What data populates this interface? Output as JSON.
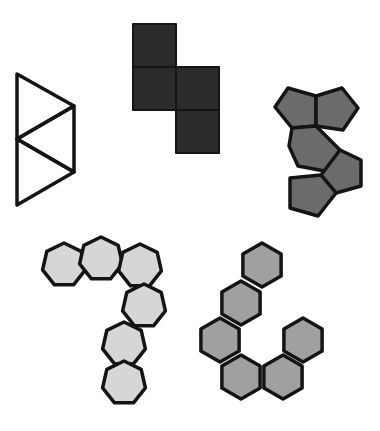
{
  "figure": {
    "width": 380,
    "height": 431,
    "background": "#ffffff",
    "stroke_color": "#141414",
    "shapes": [
      {
        "id": "triangle-strip",
        "kind": "triangles",
        "count": 3,
        "fill": "none",
        "stroke_width": 3.5,
        "polygons": [
          [
            [
              17,
              74
            ],
            [
              74,
              106
            ],
            [
              17,
              139
            ]
          ],
          [
            [
              74,
              106
            ],
            [
              74,
              172
            ],
            [
              17,
              139
            ]
          ],
          [
            [
              17,
              139
            ],
            [
              74,
              172
            ],
            [
              17,
              205
            ]
          ]
        ]
      },
      {
        "id": "square-tetromino",
        "kind": "squares",
        "count": 4,
        "fill": "#2b2b2b",
        "stroke_width": 2,
        "polygons": [
          [
            [
              133,
              24
            ],
            [
              176,
              24
            ],
            [
              176,
              67
            ],
            [
              133,
              67
            ]
          ],
          [
            [
              133,
              67
            ],
            [
              176,
              67
            ],
            [
              176,
              110
            ],
            [
              133,
              110
            ]
          ],
          [
            [
              176,
              67
            ],
            [
              219,
              67
            ],
            [
              219,
              110
            ],
            [
              176,
              110
            ]
          ],
          [
            [
              176,
              110
            ],
            [
              219,
              110
            ],
            [
              219,
              153
            ],
            [
              176,
              153
            ]
          ]
        ]
      },
      {
        "id": "pentagon-cluster",
        "kind": "pentagons",
        "count": 5,
        "fill": "#6b6b6b",
        "stroke_width": 3.5,
        "polygons": [
          [
            [
              288,
              88
            ],
            [
              316,
              96
            ],
            [
              316,
              126
            ],
            [
              292,
              128
            ],
            [
              275,
              107
            ]
          ],
          [
            [
              316,
              96
            ],
            [
              342,
              88
            ],
            [
              358,
              108
            ],
            [
              343,
              130
            ],
            [
              316,
              126
            ]
          ],
          [
            [
              292,
              128
            ],
            [
              316,
              126
            ],
            [
              340,
              150
            ],
            [
              330,
              172
            ],
            [
              298,
              166
            ],
            [
              289,
              146
            ]
          ],
          [
            [
              340,
              150
            ],
            [
              361,
              160
            ],
            [
              361,
              186
            ],
            [
              336,
              193
            ],
            [
              321,
              175
            ]
          ],
          [
            [
              290,
              178
            ],
            [
              321,
              175
            ],
            [
              336,
              193
            ],
            [
              318,
              216
            ],
            [
              290,
              208
            ]
          ]
        ]
      },
      {
        "id": "heptagon-chain",
        "kind": "heptagons",
        "count": 6,
        "fill": "#d6d6d6",
        "stroke_width": 3.5,
        "centers": [
          [
            64,
            265
          ],
          [
            101,
            259
          ],
          [
            140,
            266
          ],
          [
            144,
            306
          ],
          [
            124,
            344
          ],
          [
            124,
            383
          ]
        ],
        "radius": 22
      },
      {
        "id": "hexagon-chain",
        "kind": "hexagons",
        "count": 7,
        "fill": "#a0a0a0",
        "stroke_width": 3.5,
        "centers": [
          [
            262,
            265
          ],
          [
            241,
            303
          ],
          [
            220,
            340
          ],
          [
            241,
            377
          ],
          [
            283,
            377
          ],
          [
            303,
            340
          ]
        ],
        "extra_center": [
          262,
          265
        ],
        "radius": 22
      }
    ]
  }
}
